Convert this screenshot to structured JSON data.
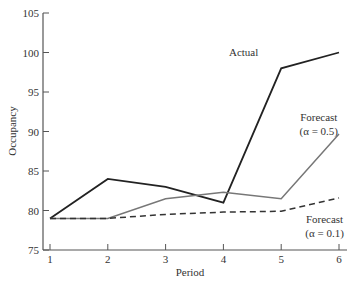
{
  "top_text": "a simple exponential smoothing with a fairly smooth exponential",
  "chart_data": {
    "type": "line",
    "title": "",
    "xlabel": "Period",
    "ylabel": "Occupancy",
    "x": [
      1,
      2,
      3,
      4,
      5,
      6
    ],
    "xticks": [
      "1",
      "2",
      "3",
      "4",
      "5",
      "6"
    ],
    "yticks": [
      "75",
      "80",
      "85",
      "90",
      "95",
      "100",
      "105"
    ],
    "ylim": [
      75,
      105
    ],
    "xlim": [
      0.9,
      6.15
    ],
    "grid": false,
    "legend": "inline annotations",
    "series": [
      {
        "name": "Actual",
        "values": [
          79,
          84,
          83,
          81,
          98,
          100
        ],
        "style": "solid",
        "color": "#222222"
      },
      {
        "name": "Forecast (α = 0.5)",
        "values": [
          79,
          79,
          81.5,
          82.3,
          81.5,
          89.7
        ],
        "style": "solid",
        "color": "#777777"
      },
      {
        "name": "Forecast (α = 0.1)",
        "values": [
          79,
          79,
          79.5,
          79.8,
          79.9,
          81.6
        ],
        "style": "dashed",
        "color": "#333333"
      }
    ],
    "annotations": [
      {
        "text": "Actual",
        "x": 4.35,
        "y": 99.5
      },
      {
        "text": "Forecast",
        "x": 5.65,
        "y": 91.3
      },
      {
        "text": "(α = 0.5)",
        "x": 5.65,
        "y": 89.5
      },
      {
        "text": "Forecast",
        "x": 5.75,
        "y": 78.4
      },
      {
        "text": "(α = 0.1)",
        "x": 5.75,
        "y": 76.6
      }
    ]
  }
}
